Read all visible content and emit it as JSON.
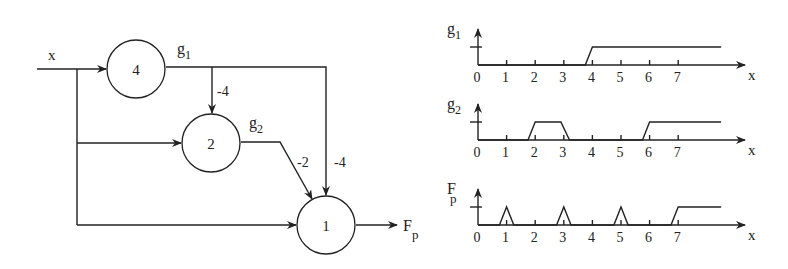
{
  "network": {
    "input_label": "x",
    "output_label_main": "F",
    "output_label_sub": "p",
    "nodes": [
      {
        "id": "node-4",
        "threshold": "4",
        "output_label": "g",
        "output_sub": "1"
      },
      {
        "id": "node-2",
        "threshold": "2",
        "output_label": "g",
        "output_sub": "2"
      },
      {
        "id": "node-1",
        "threshold": "1"
      }
    ],
    "weights": {
      "g1_to_node2": "-4",
      "g2_to_node1": "-2",
      "g1_to_node1": "-4"
    }
  },
  "plots": [
    {
      "ylabel": "g",
      "ysub": "1",
      "xlabel": "x",
      "ticks": [
        "0",
        "1",
        "2",
        "3",
        "4",
        "5",
        "6",
        "7"
      ]
    },
    {
      "ylabel": "g",
      "ysub": "2",
      "xlabel": "x",
      "ticks": [
        "0",
        "1",
        "2",
        "3",
        "4",
        "5",
        "6",
        "7"
      ]
    },
    {
      "ylabel": "F",
      "ysub": "p",
      "xlabel": "x",
      "ticks": [
        "0",
        "1",
        "2",
        "3",
        "4",
        "5",
        "6",
        "7"
      ]
    }
  ],
  "chart_data": [
    {
      "type": "line",
      "title": "g1",
      "xlabel": "x",
      "ylabel": "g1",
      "x": [
        0,
        3.75,
        4,
        8.5
      ],
      "values": [
        0,
        0,
        1,
        1
      ],
      "xlim": [
        0,
        9
      ],
      "ylim": [
        0,
        1
      ]
    },
    {
      "type": "line",
      "title": "g2",
      "xlabel": "x",
      "ylabel": "g2",
      "x": [
        0,
        1.75,
        2,
        2.9,
        3.2,
        5.75,
        6,
        8.5
      ],
      "values": [
        0,
        0,
        1,
        1,
        0,
        0,
        1,
        1
      ],
      "xlim": [
        0,
        9
      ],
      "ylim": [
        0,
        1
      ]
    },
    {
      "type": "line",
      "title": "Fp",
      "xlabel": "x",
      "ylabel": "Fp",
      "x": [
        0,
        0.75,
        1,
        1.25,
        2.75,
        3,
        3.25,
        4.75,
        5,
        5.25,
        6.75,
        7,
        8.5
      ],
      "values": [
        0,
        0,
        1,
        0,
        0,
        1,
        0,
        0,
        1,
        0,
        0,
        1,
        1
      ],
      "xlim": [
        0,
        9
      ],
      "ylim": [
        0,
        1
      ]
    }
  ]
}
